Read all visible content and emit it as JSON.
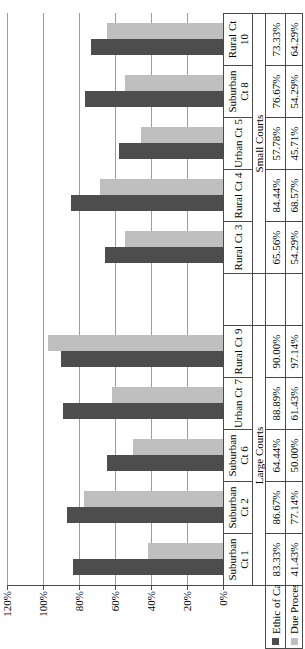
{
  "chart_data": {
    "type": "bar",
    "title": "",
    "orientation": "column chart rotated 90 degrees counterclockwise",
    "categories": [
      "Suburban Ct 1",
      "Suburban Ct 2",
      "Suburban Ct 6",
      "Urban Ct 7",
      "Rural Ct 9",
      "",
      "Rural Ct 3",
      "Rural Ct 4",
      "Urban Ct 5",
      "Suburban Ct 8",
      "Rural Ct 10"
    ],
    "category_groups": [
      {
        "label": "Large Courts",
        "span": 5
      },
      {
        "label": "",
        "span": 1
      },
      {
        "label": "Small Courts",
        "span": 5
      }
    ],
    "series": [
      {
        "name": "Ethic of Care",
        "color": "#4d4d4d",
        "values": [
          83.33,
          86.67,
          64.44,
          88.89,
          90.0,
          null,
          65.56,
          84.44,
          57.78,
          76.67,
          73.33
        ]
      },
      {
        "name": "Due Process",
        "color": "#bfbfbf",
        "values": [
          41.43,
          77.14,
          50.0,
          61.43,
          97.14,
          null,
          54.29,
          68.57,
          45.71,
          54.29,
          64.29
        ]
      }
    ],
    "value_suffix": "%",
    "y_ticks": [
      "0%",
      "20%",
      "40%",
      "60%",
      "80%",
      "100%",
      "120%"
    ],
    "ylim": [
      0,
      120
    ],
    "grid": true,
    "gridline_color": "#9c9c9c",
    "border_color": "#4a4a4a",
    "data_table_shown": true,
    "legend_position": "left of data table rows"
  },
  "legend": {
    "items": [
      {
        "label": "Ethic of Care",
        "color": "#4d4d4d"
      },
      {
        "label": "Due Process",
        "color": "#bfbfbf"
      }
    ]
  }
}
